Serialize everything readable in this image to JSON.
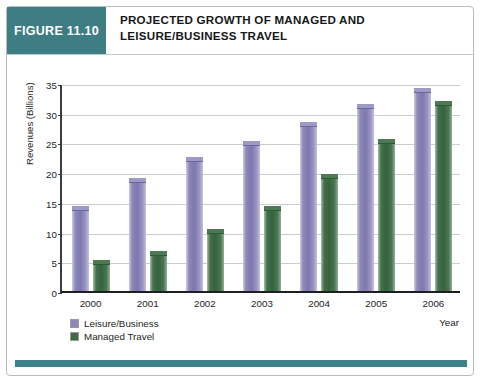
{
  "figure": {
    "badge": "FIGURE 11.10",
    "title_line1": "PROJECTED GROWTH OF MANAGED AND",
    "title_line2": "LEISURE/BUSINESS TRAVEL"
  },
  "legend": {
    "items": [
      {
        "label": "Leisure/Business",
        "color": "#8d88b8"
      },
      {
        "label": "Managed Travel",
        "color": "#3d6b44"
      }
    ]
  },
  "colors": {
    "badge_teal": "#3e7d83",
    "footer_teal": "#3f8189",
    "leisure_purple": "#8d88b8",
    "managed_green": "#3d6b44",
    "gridline": "#c9cdcd",
    "axis": "#1d1f21"
  },
  "chart_data": {
    "type": "bar",
    "title": "PROJECTED GROWTH OF MANAGED AND LEISURE/BUSINESS TRAVEL",
    "xlabel": "Year",
    "ylabel": "Revenues (Billions)",
    "categories": [
      "2000",
      "2001",
      "2002",
      "2003",
      "2004",
      "2005",
      "2006"
    ],
    "series": [
      {
        "name": "Leisure/Business",
        "color": "#8d88b8",
        "values": [
          13.8,
          18.5,
          22.1,
          24.7,
          28.0,
          30.9,
          33.6
        ]
      },
      {
        "name": "Managed Travel",
        "color": "#3d6b44",
        "values": [
          4.7,
          6.2,
          9.9,
          13.8,
          19.2,
          25.0,
          31.4
        ]
      }
    ],
    "ylim": [
      0,
      35
    ],
    "yticks": [
      0,
      5,
      10,
      15,
      20,
      25,
      30,
      35
    ],
    "ytick_labels": [
      "0",
      "5",
      "10",
      "15",
      "20",
      "25",
      "30",
      "35"
    ],
    "grid": true,
    "legend_position": "bottom-left"
  }
}
